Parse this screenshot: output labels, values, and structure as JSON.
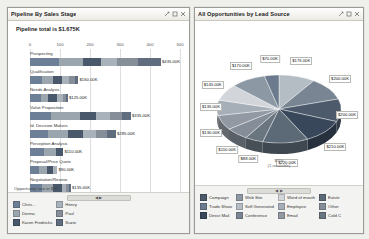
{
  "left_panel": {
    "title": "Pipeline By Sales Stage",
    "subtitle": "Pipeline total is $1.675K",
    "note": "Opportunity size in $1k",
    "scroll_label": "◀  ▶",
    "window_buttons": [
      "restore-icon",
      "maximize-icon",
      "close-icon"
    ],
    "legend": [
      [
        {
          "label": "Chris...",
          "color": "#6d7f96"
        },
        {
          "label": "Donna",
          "color": "#9aa5ae"
        },
        {
          "label": "Karen Fredricks",
          "color": "#49586b"
        }
      ],
      [
        {
          "label": "Henry",
          "color": "#a9b2bb"
        },
        {
          "label": "Paul",
          "color": "#868f99"
        },
        {
          "label": "Suzie",
          "color": "#5f6d7e"
        }
      ]
    ]
  },
  "right_panel": {
    "title": "All Opportunities by Lead Source",
    "center_label_line1": "$70k",
    "center_label_line2": "(1 available)",
    "scroll_label": "◀  ▶",
    "window_buttons": [
      "restore-icon",
      "maximize-icon",
      "close-icon"
    ],
    "legend": [
      [
        {
          "label": "Campaign",
          "color": "#4c5a6b"
        },
        {
          "label": "Trade Show",
          "color": "#6b7a8c"
        },
        {
          "label": "Direct Mail",
          "color": "#39475a"
        }
      ],
      [
        {
          "label": "Web Site",
          "color": "#8d98a5"
        },
        {
          "label": "Self Generated",
          "color": "#b4bcc4"
        },
        {
          "label": "Conference",
          "color": "#7a8593"
        }
      ],
      [
        {
          "label": "Word of mouth",
          "color": "#d2d6da"
        },
        {
          "label": "Employee",
          "color": "#a6aeb8"
        },
        {
          "label": "Email",
          "color": "#9299a3"
        }
      ],
      [
        {
          "label": "Existir",
          "color": "#5c6977"
        },
        {
          "label": "Other",
          "color": "#848d98"
        },
        {
          "label": "Cold C",
          "color": "#69757f"
        }
      ]
    ]
  },
  "chart_data": [
    {
      "type": "bar",
      "orientation": "horizontal",
      "title": "Pipeline By Sales Stage",
      "subtitle": "Pipeline total is $1.675K",
      "xlabel": "Opportunity size in $1k",
      "ylabel": "",
      "xlim": [
        0,
        500
      ],
      "xticks": [
        0,
        100,
        200,
        300,
        400,
        500
      ],
      "grid": true,
      "categories": [
        "Prospecting",
        "Qualification",
        "Needs Analysis",
        "Value Proposition",
        "Id. Decision Makers",
        "Perception Analysis",
        "Proposal/Price Quote",
        "Negotiation/Review"
      ],
      "values": [
        435,
        160,
        125,
        335,
        285,
        110,
        90,
        135
      ],
      "value_labels": [
        "$435.00K",
        "$160.00K",
        "$125.00K",
        "$335.00K",
        "$285.00K",
        "$110.00K",
        "$90.00K",
        "$135.00K"
      ],
      "stacked": true,
      "series": [
        {
          "name": "Chris...",
          "color": "#6d7f96",
          "values": [
            95,
            40,
            35,
            70,
            60,
            45,
            30,
            40
          ]
        },
        {
          "name": "Donna",
          "color": "#9aa5ae",
          "values": [
            80,
            35,
            25,
            95,
            65,
            40,
            25,
            35
          ]
        },
        {
          "name": "Karen Fredricks",
          "color": "#49586b",
          "values": [
            60,
            30,
            30,
            55,
            50,
            25,
            20,
            30
          ]
        },
        {
          "name": "Henry",
          "color": "#a9b2bb",
          "values": [
            55,
            25,
            20,
            45,
            45,
            0,
            15,
            15
          ]
        },
        {
          "name": "Paul",
          "color": "#868f99",
          "values": [
            70,
            20,
            10,
            40,
            35,
            0,
            0,
            10
          ]
        },
        {
          "name": "Suzie",
          "color": "#5f6d7e",
          "values": [
            75,
            10,
            5,
            30,
            30,
            0,
            0,
            5
          ]
        }
      ]
    },
    {
      "type": "pie",
      "title": "All Opportunities by Lead Source",
      "three_d": true,
      "legend_position": "bottom",
      "center_annotation": "$70k (1 available)",
      "labels": [
        "Campaign",
        "Trade Show",
        "Direct Mail",
        "Web Site",
        "Self Generated",
        "Conference",
        "Word of mouth",
        "Employee",
        "Email",
        "Existir",
        "Other",
        "Cold C"
      ],
      "values": [
        175,
        200,
        200,
        210,
        220,
        88,
        110,
        130,
        135,
        145,
        170,
        70
      ],
      "value_labels": [
        "$175.00K",
        "$200.00K",
        "$200.00K",
        "$210.00K",
        "$220.00K",
        "$88.00K",
        "$110.00K",
        "$130.00K",
        "$135.00K",
        "$145.00K",
        "$170.00K",
        "$70.00K"
      ],
      "colors": [
        "#b4bcc4",
        "#7a8593",
        "#4c5a6b",
        "#39475a",
        "#5c6977",
        "#69757f",
        "#848d98",
        "#9299a3",
        "#a6aeb8",
        "#d2d6da",
        "#8d98a5",
        "#6b7a8c"
      ]
    }
  ]
}
